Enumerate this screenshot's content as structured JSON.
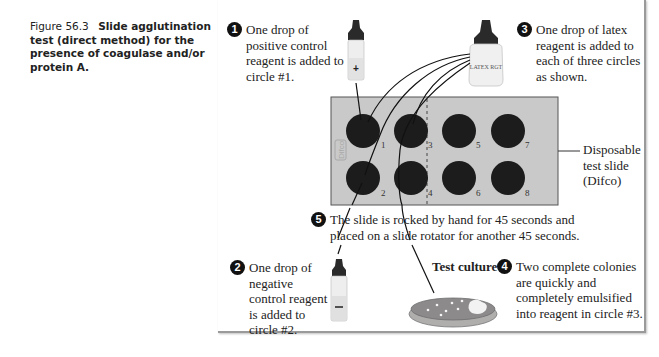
{
  "caption": {
    "figure_number": "Figure 56.3",
    "title": "Slide agglutination test (direct method) for the presence of coagulase and/or protein A."
  },
  "steps": [
    {
      "number": "1",
      "text": "One drop of positive control reagent is added to circle #1."
    },
    {
      "number": "2",
      "text": "One drop of negative control reagent is added to circle #2."
    },
    {
      "number": "3",
      "text": "One drop of latex reagent is added to each of three circles as shown."
    },
    {
      "number": "4",
      "text": "Two complete colonies are quickly and completely emulsified into reagent in circle #3."
    },
    {
      "number": "5",
      "text": "The slide is rocked by hand for 45 seconds and placed on a slide rotator for another 45 seconds."
    }
  ],
  "labels": {
    "slide": "Disposable test slide (Difco)",
    "slide_brand": "Difco",
    "test_culture": "Test culture",
    "latex_bottle": "LATEX RGT",
    "positive_symbol": "+",
    "negative_symbol": "—"
  },
  "slide": {
    "circles": [
      {
        "id": "1",
        "label": "1"
      },
      {
        "id": "2",
        "label": "2"
      },
      {
        "id": "3",
        "label": "3"
      },
      {
        "id": "4",
        "label": "4"
      },
      {
        "id": "5",
        "label": "5"
      },
      {
        "id": "6",
        "label": "6"
      },
      {
        "id": "7",
        "label": "7"
      },
      {
        "id": "8",
        "label": "8"
      }
    ]
  },
  "colors": {
    "slide_bg": "#c9c9c9",
    "circle_fill": "#1c1c1c",
    "bullet": "#111111",
    "border": "#9a9a9a",
    "dish": "#8c8a8a"
  }
}
